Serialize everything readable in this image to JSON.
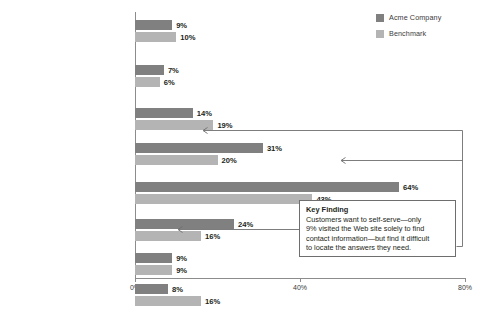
{
  "chart_data": {
    "type": "bar",
    "orientation": "horizontal",
    "title": "",
    "xlabel": "",
    "ylabel": "",
    "xlim": [
      0,
      80
    ],
    "xticks": [
      "0%",
      "40%",
      "80%"
    ],
    "xtick_values": [
      0,
      40,
      80
    ],
    "grid": false,
    "legend_position": "top-right",
    "categories": [
      "I Experienced Technical Difficulties with the Web Site and/or My Internet Browser",
      "The Appearance of the Web Site Did Not Make Me Feel Confident That I Would Find an Answer",
      "My Issue Seemed Too Complex",
      "The Information Was Presented in an Unclear Manner",
      "I Could Not Find What I Was Looking For",
      "The Web Site Directed Me to Call the Company About My Issue",
      "I Only Visited the Web Site to Obtain the Company's Phone Number or Send Them an E-mail",
      "Other"
    ],
    "category_lines": [
      [
        "I Experienced Technical",
        "Difficulties with the Web Site",
        "and/or My Internet Browser"
      ],
      [
        "The Appearance of the Web Site",
        "Did Not Make Me Feel Confident",
        "That I Would Find an Answer"
      ],
      [
        "My Issue Seemed",
        "Too Complex"
      ],
      [
        "The Information",
        "Was Presented in an",
        "Unclear Manner"
      ],
      [
        "I Could Not Find What I",
        "Was Looking For"
      ],
      [
        "The Web Site Directed Me",
        "to Call the Company About",
        "My Issue"
      ],
      [
        "I Only Visited the Web Site to",
        "Obtain the Company's Phone",
        "Number or Send Them an E-mail"
      ],
      [
        "Other"
      ]
    ],
    "series": [
      {
        "name": "Acme Company",
        "color": "#808080",
        "values": [
          9,
          7,
          14,
          31,
          64,
          24,
          9,
          8
        ],
        "labels": [
          "9%",
          "7%",
          "14%",
          "31%",
          "64%",
          "24%",
          "9%",
          "8%"
        ]
      },
      {
        "name": "Benchmark",
        "color": "#b4b4b4",
        "values": [
          10,
          6,
          19,
          20,
          43,
          16,
          9,
          16
        ],
        "labels": [
          "10%",
          "6%",
          "19%",
          "20%",
          "43%",
          "16%",
          "9%",
          "16%"
        ]
      }
    ],
    "annotations": {
      "callout_title": "Key Finding",
      "callout_text": "Customers want to self-serve—only 9% visited the Web site solely to find contact information—but find it difficult to locate the answers they need.",
      "callout_lines": [
        "Customers want to self-serve—only",
        "9% visited the Web site solely to find",
        "contact information—but find it difficult",
        "to locate the answers they need."
      ],
      "arrow_targets": [
        "31%",
        "64%",
        "9%"
      ]
    }
  },
  "legend": {
    "items": [
      {
        "label": "Acme Company",
        "color": "#808080"
      },
      {
        "label": "Benchmark",
        "color": "#b4b4b4"
      }
    ]
  },
  "footer": {
    "caption": ""
  }
}
